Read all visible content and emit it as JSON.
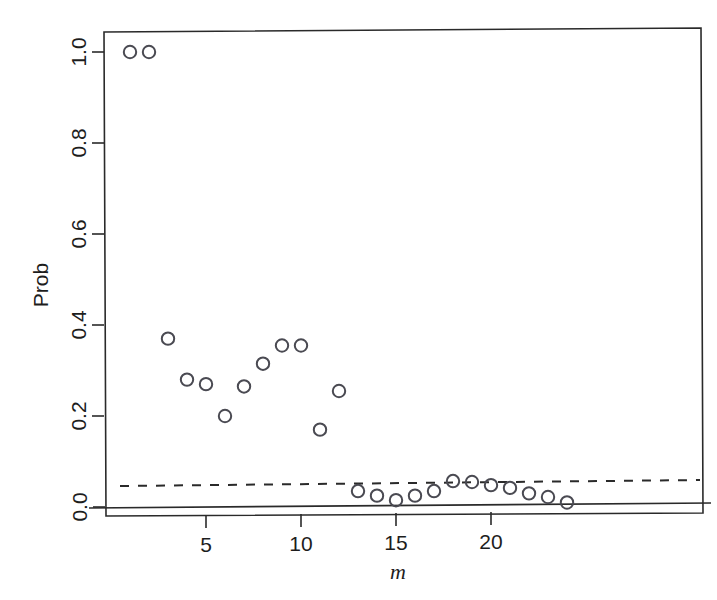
{
  "chart_data": {
    "type": "scatter",
    "title": "",
    "xlabel": "m",
    "ylabel": "Prob",
    "xlim": [
      0.35,
      24.9
    ],
    "ylim": [
      -0.045,
      1.055
    ],
    "grid": false,
    "legend": "none",
    "xticks": [
      5,
      10,
      15,
      20
    ],
    "xtick_labels": [
      "5",
      "10",
      "15",
      "20"
    ],
    "yticks": [
      0.0,
      0.2,
      0.4,
      0.6,
      0.8,
      1.0
    ],
    "ytick_labels": [
      "0.0",
      "0.2",
      "0.4",
      "0.6",
      "0.8",
      "1.0"
    ],
    "x": [
      1,
      2,
      3,
      4,
      5,
      6,
      7,
      8,
      9,
      10,
      11,
      12,
      13,
      14,
      15,
      16,
      17,
      18,
      19,
      20,
      21,
      22,
      23,
      24
    ],
    "values": [
      1.0,
      1.0,
      0.37,
      0.28,
      0.27,
      0.2,
      0.265,
      0.315,
      0.355,
      0.355,
      0.17,
      0.255,
      0.035,
      0.025,
      0.015,
      0.025,
      0.035,
      0.057,
      0.055,
      0.048,
      0.042,
      0.03,
      0.022,
      0.01
    ],
    "series": [
      {
        "name": "Prob",
        "marker": "open-circle",
        "values": [
          1.0,
          1.0,
          0.37,
          0.28,
          0.27,
          0.2,
          0.265,
          0.315,
          0.355,
          0.355,
          0.17,
          0.255,
          0.035,
          0.025,
          0.015,
          0.025,
          0.035,
          0.057,
          0.055,
          0.048,
          0.042,
          0.03,
          0.022,
          0.01
        ]
      }
    ],
    "reference_lines": [
      {
        "name": "zero-line",
        "y": 0.0,
        "style": "solid"
      },
      {
        "name": "significance-line",
        "y": 0.05,
        "style": "dashed"
      }
    ],
    "marker_color": "#4a4a52",
    "line_color": "#2a2a2a"
  },
  "axes": {
    "y_label": "Prob",
    "x_label": "m"
  }
}
